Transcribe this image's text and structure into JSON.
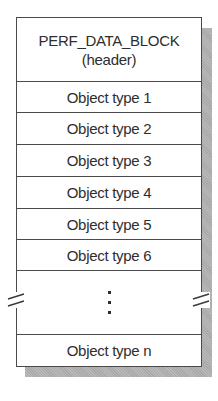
{
  "diagram": {
    "header": {
      "line1": "PERF_DATA_BLOCK",
      "line2": "(header)"
    },
    "object_types": [
      {
        "label": "Object type 1"
      },
      {
        "label": "Object type 2"
      },
      {
        "label": "Object type 3"
      },
      {
        "label": "Object type 4"
      },
      {
        "label": "Object type 5"
      },
      {
        "label": "Object type 6"
      }
    ],
    "ellipsis": "vertical-ellipsis",
    "last_object_type": {
      "label": "Object type n"
    },
    "break_marks": [
      "left-break-icon",
      "right-break-icon"
    ],
    "colors": {
      "border": "#4a4a4a",
      "text": "#2e2e2e",
      "shadow": "#a9a9a9",
      "fill": "#ffffff"
    }
  }
}
